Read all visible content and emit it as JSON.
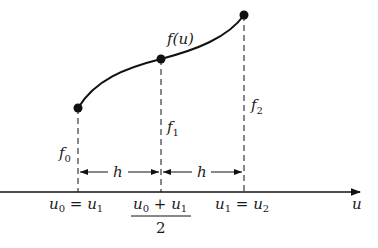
{
  "diagram": {
    "curve_label": "f(u)",
    "axis_label": "u",
    "points": [
      {
        "name": "f",
        "sub": "0",
        "x": 78,
        "y": 108
      },
      {
        "name": "f",
        "sub": "1",
        "x": 161,
        "y": 59
      },
      {
        "name": "f",
        "sub": "2",
        "x": 244,
        "y": 15
      }
    ],
    "spacing_labels": [
      "h",
      "h"
    ],
    "x_ticks": [
      {
        "a": "u",
        "a_sub": "0",
        "eq": " = ",
        "b": "u",
        "b_sub": "1"
      },
      {
        "num_a": "u",
        "num_a_sub": "0",
        "plus": " + ",
        "num_b": "u",
        "num_b_sub": "1",
        "den": "2"
      },
      {
        "a": "u",
        "a_sub": "1",
        "eq": " = ",
        "b": "u",
        "b_sub": "2"
      }
    ]
  }
}
